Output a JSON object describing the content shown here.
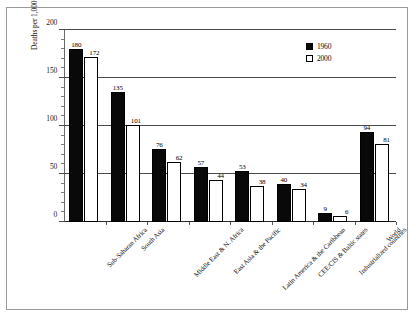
{
  "chart_data": {
    "type": "bar",
    "title": "",
    "xlabel": "",
    "ylabel": "Deaths per 1,000 Live Births",
    "ylim": [
      0,
      200
    ],
    "yticks": [
      0,
      50,
      100,
      150,
      200
    ],
    "ytick_labels": [
      "0",
      "50",
      "100",
      "150",
      "200"
    ],
    "grid": true,
    "legend_position": "top-right",
    "categories": [
      "Sub-Saharan Africa",
      "South Asia",
      "Middle East & N. Africa",
      "East Asia & the Pacific",
      "Latin America & the Caribbean",
      "CEE/CIS & Baltic states",
      "Industrialized countries",
      "World"
    ],
    "series": [
      {
        "name": "1960",
        "color": "#090909",
        "values": [
          180,
          135,
          76,
          57,
          53,
          40,
          9,
          94
        ]
      },
      {
        "name": "2000",
        "color": "#ffffff",
        "values": [
          172,
          101,
          62,
          44,
          38,
          34,
          6,
          81
        ]
      }
    ]
  },
  "legend": {
    "items": [
      {
        "label": "1960",
        "swatch": "filled-square"
      },
      {
        "label": "2000",
        "swatch": "hollow-square"
      }
    ]
  }
}
